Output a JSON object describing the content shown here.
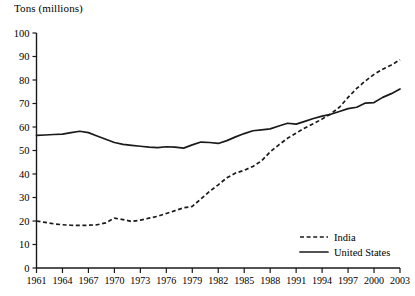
{
  "chart_data": {
    "type": "line",
    "title": "Tons (millions)",
    "xlabel": "",
    "ylabel": "Tons (millions)",
    "ylim": [
      0,
      100
    ],
    "xlim": [
      1961,
      2003
    ],
    "ytick_step": 10,
    "xtick_step": 3,
    "grid": false,
    "legend_position": "bottom-right",
    "yticks": [
      0,
      10,
      20,
      30,
      40,
      50,
      60,
      70,
      80,
      90,
      100
    ],
    "xticks": [
      1961,
      1964,
      1967,
      1970,
      1973,
      1976,
      1979,
      1982,
      1985,
      1988,
      1991,
      1994,
      1997,
      2000,
      2003
    ],
    "x": [
      1961,
      1962,
      1963,
      1964,
      1965,
      1966,
      1967,
      1968,
      1969,
      1970,
      1971,
      1972,
      1973,
      1974,
      1975,
      1976,
      1977,
      1978,
      1979,
      1980,
      1981,
      1982,
      1983,
      1984,
      1985,
      1986,
      1987,
      1988,
      1989,
      1990,
      1991,
      1992,
      1993,
      1994,
      1995,
      1996,
      1997,
      1998,
      1999,
      2000,
      2001,
      2002,
      2003
    ],
    "series": [
      {
        "name": "India",
        "style": "dashed",
        "color": "#1a1a1a",
        "values": [
          20,
          19.4,
          18.8,
          18.4,
          18.2,
          18.1,
          18.2,
          18.4,
          19.2,
          21.2,
          20.6,
          19.8,
          20.4,
          21.2,
          22,
          23.2,
          24.4,
          25.6,
          26.2,
          29.4,
          32.6,
          35.4,
          38.4,
          40.4,
          41.6,
          43.2,
          45.6,
          49.4,
          52.4,
          55.2,
          57.4,
          59.6,
          61.4,
          63.4,
          65.6,
          68.4,
          72.6,
          76.4,
          79.6,
          82.4,
          84.6,
          86.4,
          88.6
        ]
      },
      {
        "name": "United States",
        "style": "solid",
        "color": "#1a1a1a",
        "values": [
          56.4,
          56.6,
          56.8,
          57,
          57.6,
          58.2,
          57.6,
          56.2,
          54.8,
          53.4,
          52.6,
          52.2,
          51.8,
          51.4,
          51.2,
          51.6,
          51.4,
          51,
          52.4,
          53.6,
          53.4,
          53,
          54.2,
          55.8,
          57.2,
          58.4,
          58.8,
          59.2,
          60.4,
          61.6,
          61.2,
          62.4,
          63.6,
          64.6,
          65.4,
          66.6,
          67.8,
          68.4,
          70.2,
          70.4,
          72.6,
          74.2,
          76.2
        ]
      }
    ]
  },
  "legend": {
    "entries": [
      {
        "label": "India",
        "style": "dashed"
      },
      {
        "label": "United States",
        "style": "solid"
      }
    ]
  }
}
